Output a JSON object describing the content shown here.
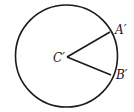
{
  "diagram": {
    "type": "circle-with-central-angle",
    "circle": {
      "cx": 66.5,
      "cy": 56,
      "r": 51,
      "stroke": "#1a1a1a"
    },
    "center": {
      "label": "C′",
      "x": 67,
      "y": 57
    },
    "points": [
      {
        "id": "A",
        "label": "A′",
        "x": 110,
        "y": 32
      },
      {
        "id": "B",
        "label": "B′",
        "x": 111,
        "y": 75
      }
    ],
    "segments": [
      {
        "from": "center",
        "to": "A"
      },
      {
        "from": "center",
        "to": "B"
      }
    ],
    "colors": {
      "line": "#1a1a1a",
      "background": "#ffffff"
    }
  }
}
